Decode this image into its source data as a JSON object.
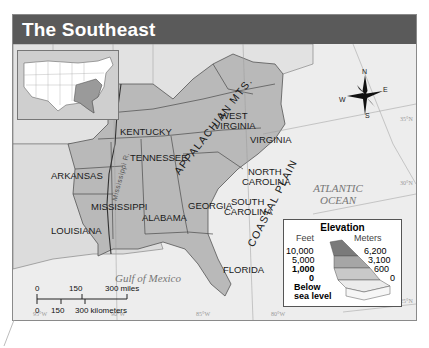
{
  "header": {
    "title": "The Southeast"
  },
  "states": [
    {
      "name": "KENTUCKY"
    },
    {
      "name": "WEST VIRGINIA",
      "line1": "WEST",
      "line2": "VIRGINIA"
    },
    {
      "name": "VIRGINIA"
    },
    {
      "name": "TENNESSEE"
    },
    {
      "name": "NORTH CAROLINA",
      "line1": "NORTH",
      "line2": "CAROLINA"
    },
    {
      "name": "SOUTH CAROLINA",
      "line1": "SOUTH",
      "line2": "CAROLINA"
    },
    {
      "name": "ARKANSAS"
    },
    {
      "name": "MISSISSIPPI"
    },
    {
      "name": "ALABAMA"
    },
    {
      "name": "GEORGIA"
    },
    {
      "name": "LOUISIANA"
    },
    {
      "name": "FLORIDA"
    }
  ],
  "features": {
    "mountains": "APPALACHIAN MTS.",
    "coastal_plain": "COASTAL PLAIN",
    "river": "Mississippi R.",
    "ocean_line1": "ATLANTIC",
    "ocean_line2": "OCEAN",
    "gulf": "Gulf of Mexico"
  },
  "compass": {
    "n": "N",
    "s": "S",
    "e": "E",
    "w": "W"
  },
  "coordinates": {
    "longitudes": [
      "95°W",
      "90°W",
      "85°W",
      "80°W"
    ],
    "latitudes": [
      "35°N",
      "30°N",
      "25°N"
    ]
  },
  "legend": {
    "title": "Elevation",
    "feet_label": "Feet",
    "meters_label": "Meters",
    "feet": [
      "10,000",
      "5,000",
      "1,000",
      "0"
    ],
    "meters": [
      "6,200",
      "3,100",
      "600",
      "0"
    ],
    "below_line1": "Below",
    "below_line2": "sea level",
    "colors": [
      "#7a7a7a",
      "#a6a6a6",
      "#c9c9c9",
      "#e4e4e4",
      "#f4f4f4"
    ]
  },
  "scale": {
    "miles": [
      "0",
      "150",
      "300 miles"
    ],
    "kilometers": [
      "0",
      "150",
      "300 kilometers"
    ]
  },
  "colors": {
    "header_bg": "#5a5a5a",
    "land_region": "#b8b8b8",
    "land_other": "#e2e2e2",
    "water": "#eeeeee",
    "highlight": "#9a9a9a"
  }
}
